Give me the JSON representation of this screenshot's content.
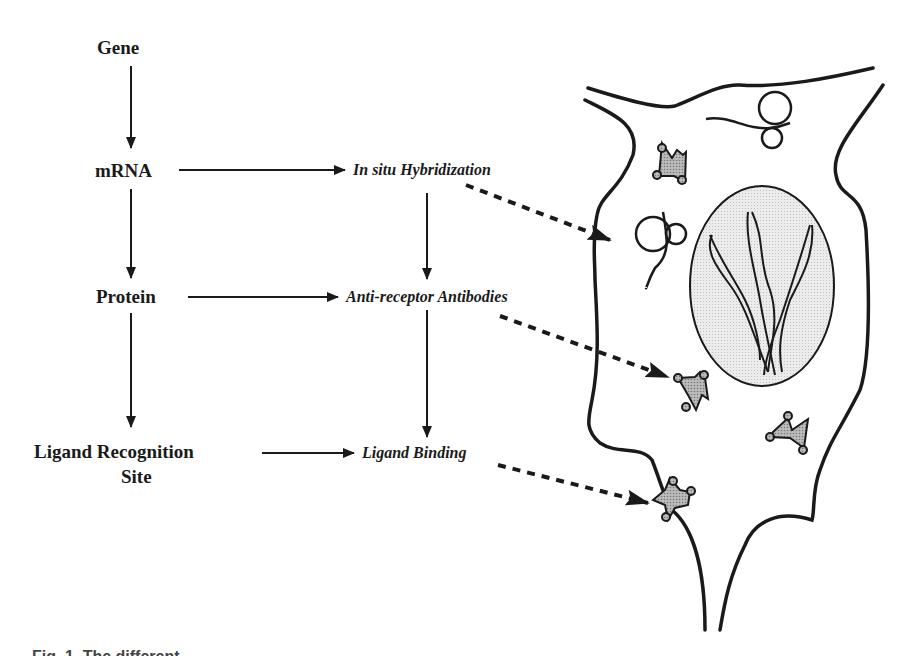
{
  "diagram": {
    "left_column": [
      {
        "id": "gene",
        "label": "Gene"
      },
      {
        "id": "mrna",
        "label": "mRNA"
      },
      {
        "id": "protein",
        "label": "Protein"
      },
      {
        "id": "ligand_site",
        "label": "Ligand Recognition",
        "label_line2": "Site"
      }
    ],
    "middle_column": [
      {
        "id": "ish",
        "label": "In situ Hybridization"
      },
      {
        "id": "antibodies",
        "label": "Anti-receptor Antibodies"
      },
      {
        "id": "binding",
        "label": "Ligand Binding"
      }
    ],
    "cell_illustration": {
      "elements": [
        "cell-membrane",
        "nucleus",
        "chromosomes",
        "mrna-strands",
        "receptor-proteins"
      ]
    },
    "colors": {
      "ink": "#1a1a1a",
      "nucleus_fill": "#e6e6e6",
      "receptor_fill": "#a8a8a8"
    },
    "caption": "Fig. 1. The different ..."
  }
}
